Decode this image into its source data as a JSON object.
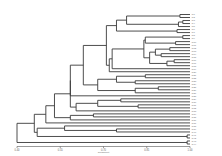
{
  "chart_data": {
    "type": "dendrogram",
    "title": "",
    "xlabel": "Coefficient",
    "ylabel": "",
    "xlim": [
      0.4,
      1.0
    ],
    "x_ticks": [
      0.4,
      0.55,
      0.7,
      0.85,
      1.0
    ],
    "x_tick_labels": [
      "0.40",
      "0.55",
      "0.70",
      "0.85",
      "1.00"
    ],
    "grid": false,
    "legend": null,
    "line_color": "#3a3a3a",
    "leaf_count": 40,
    "leaves": [
      "G1",
      "G2",
      "G3",
      "G4",
      "G5",
      "G6",
      "G7",
      "G8",
      "G9",
      "G10",
      "G11",
      "G12",
      "G13",
      "G14",
      "G15",
      "G16",
      "G17",
      "G18",
      "G19",
      "G20",
      "G21",
      "G22",
      "G23",
      "G24",
      "G25",
      "G26",
      "G27",
      "G28",
      "G29",
      "G30",
      "G31",
      "G32",
      "G33",
      "G34",
      "G35",
      "G36",
      "G37",
      "G38",
      "G39",
      "G40"
    ],
    "tree": {
      "h": 0.4,
      "c": [
        {
          "h": 0.46,
          "c": [
            {
              "h": 0.5,
              "c": [
                {
                  "h": 0.53,
                  "c": [
                    {
                      "h": 0.585,
                      "c": [
                        {
                          "h": 0.585,
                          "c": [
                            {
                              "h": 0.63,
                              "c": [
                                {
                                  "h": 0.71,
                                  "c": [
                                    {
                                      "h": 0.745,
                                      "c": [
                                        {
                                          "h": 0.78,
                                          "c": [
                                            {
                                              "h": 0.965,
                                              "c": [
                                                0,
                                                1
                                              ]
                                            },
                                            {
                                              "h": 0.96,
                                              "c": [
                                                {
                                                  "h": 0.975,
                                                  "c": [
                                                    2,
                                                    3
                                                  ]
                                                },
                                                4
                                              ]
                                            }
                                          ]
                                        },
                                        {
                                          "h": 0.955,
                                          "c": [
                                            5,
                                            6
                                          ]
                                        }
                                      ]
                                    },
                                    {
                                      "h": 0.72,
                                      "c": [
                                        {
                                          "h": 0.73,
                                          "c": [
                                            {
                                              "h": 0.84,
                                              "c": [
                                                {
                                                  "h": 0.845,
                                                  "c": [
                                                    {
                                                      "h": 0.975,
                                                      "c": [
                                                        7,
                                                        8
                                                      ]
                                                    },
                                                    {
                                                      "h": 0.95,
                                                      "c": [
                                                        9,
                                                        10
                                                      ]
                                                    }
                                                  ]
                                                },
                                                {
                                                  "h": 0.86,
                                                  "c": [
                                                    {
                                                      "h": 0.88,
                                                      "c": [
                                                        {
                                                          "h": 0.93,
                                                          "c": [
                                                            11,
                                                            12
                                                          ]
                                                        },
                                                        {
                                                          "h": 0.9,
                                                          "c": [
                                                            13,
                                                            14
                                                          ]
                                                        }
                                                      ]
                                                    },
                                                    {
                                                      "h": 0.92,
                                                      "c": [
                                                        {
                                                          "h": 0.945,
                                                          "c": [
                                                            15,
                                                            16
                                                          ]
                                                        },
                                                        17
                                                      ]
                                                    }
                                                  ]
                                                }
                                              ]
                                            },
                                            18
                                          ]
                                        },
                                        19
                                      ]
                                    }
                                  ]
                                },
                                {
                                  "h": 0.68,
                                  "c": [
                                    {
                                      "h": 0.745,
                                      "c": [
                                        {
                                          "h": 0.845,
                                          "c": [
                                            20,
                                            21
                                          ]
                                        },
                                        {
                                          "h": 0.81,
                                          "c": [
                                            22,
                                            23
                                          ]
                                        }
                                      ]
                                    },
                                    {
                                      "h": 0.81,
                                      "c": [
                                        {
                                          "h": 0.89,
                                          "c": [
                                            24,
                                            25
                                          ]
                                        },
                                        26
                                      ]
                                    }
                                  ]
                                }
                              ]
                            },
                            27
                          ]
                        },
                        {
                          "h": 0.605,
                          "c": [
                            {
                              "h": 0.68,
                              "c": [
                                {
                                  "h": 0.76,
                                  "c": [
                                    28,
                                    29
                                  ]
                                },
                                {
                                  "h": 0.82,
                                  "c": [
                                    30,
                                    31
                                  ]
                                }
                              ]
                            },
                            32
                          ]
                        }
                      ]
                    },
                    {
                      "h": 0.585,
                      "c": [
                        {
                          "h": 0.665,
                          "c": [
                            33,
                            34
                          ]
                        },
                        35
                      ]
                    }
                  ]
                },
                36
              ]
            },
            {
              "h": 0.47,
              "c": [
                {
                  "h": 0.565,
                  "c": [
                    37,
                    {
                      "h": 0.745,
                      "c": [
                        38,
                        39
                      ]
                    }
                  ]
                },
                {
                  "h": 0.99,
                  "c": [
                    40,
                    41
                  ]
                }
              ]
            }
          ]
        },
        {
          "h": 0.99,
          "c": [
            42,
            43
          ]
        }
      ]
    }
  }
}
